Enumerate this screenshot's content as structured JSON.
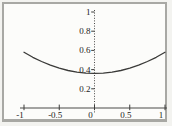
{
  "figure": {
    "kind": "scanned-math-plot",
    "background_color": "#fcfcfa",
    "frame_border_color": "#a8a8a4",
    "axis_color": "#4a4a48",
    "tick_color": "#3d3d3b",
    "label_color": "#1b1b1b",
    "curve_color": "#3a3a38"
  },
  "chart_data": {
    "type": "line",
    "title": "",
    "xlabel": "",
    "ylabel": "",
    "xlim": [
      -1,
      1
    ],
    "ylim": [
      0,
      1
    ],
    "grid": false,
    "legend": false,
    "x_ticks": {
      "values": [
        -1,
        -0.5,
        0,
        0.5,
        1
      ],
      "labels": [
        "-1",
        "-0.5",
        "0",
        "0.5",
        "1"
      ]
    },
    "y_ticks": {
      "values": [
        0.2,
        0.4,
        0.6,
        0.8,
        1
      ],
      "labels": [
        "0.2",
        "0.4",
        "0.6",
        "0.8",
        "1"
      ]
    },
    "y_axis_style": "dotted",
    "series": [
      {
        "name": "curve",
        "shape": "u-shaped symmetric curve, minimum at x=0",
        "points": {
          "x": [
            -1,
            -0.875,
            -0.75,
            -0.625,
            -0.5,
            -0.375,
            -0.25,
            -0.125,
            0,
            0.125,
            0.25,
            0.375,
            0.5,
            0.625,
            0.75,
            0.875,
            1
          ],
          "y": [
            0.58,
            0.528,
            0.484,
            0.446,
            0.415,
            0.391,
            0.374,
            0.363,
            0.36,
            0.363,
            0.374,
            0.391,
            0.415,
            0.446,
            0.484,
            0.528,
            0.58
          ]
        }
      }
    ]
  }
}
